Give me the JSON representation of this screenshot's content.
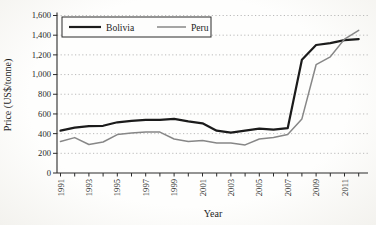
{
  "chart_data": {
    "type": "line",
    "title": "",
    "xlabel": "Year",
    "ylabel": "Price (US$/tonne)",
    "x": [
      1991,
      1992,
      1993,
      1994,
      1995,
      1996,
      1997,
      1998,
      1999,
      2000,
      2001,
      2002,
      2003,
      2004,
      2005,
      2006,
      2007,
      2008,
      2009,
      2010,
      2011,
      2012
    ],
    "x_tick_labels": [
      "1991",
      "1993",
      "1995",
      "1997",
      "1999",
      "2001",
      "2003",
      "2005",
      "2007",
      "2009",
      "2011"
    ],
    "ylim": [
      0,
      1600
    ],
    "ytick_interval": 200,
    "ytick_labels": [
      "0",
      "200",
      "400",
      "600",
      "800",
      "1,000",
      "1,200",
      "1,400",
      "1,600"
    ],
    "grid": "horizontal dotted",
    "legend": {
      "position": "top-left inside",
      "entries": [
        "Bolivia",
        "Peru"
      ]
    },
    "series": [
      {
        "name": "Bolivia",
        "color": "#1b1b1b",
        "stroke_width": 2.2,
        "values": [
          430,
          460,
          475,
          480,
          515,
          530,
          540,
          540,
          550,
          525,
          505,
          430,
          410,
          430,
          450,
          440,
          455,
          1150,
          1300,
          1320,
          1350,
          1360
        ]
      },
      {
        "name": "Peru",
        "color": "#878787",
        "stroke_width": 1.5,
        "values": [
          320,
          360,
          290,
          315,
          390,
          405,
          415,
          415,
          345,
          320,
          330,
          305,
          305,
          285,
          345,
          360,
          390,
          550,
          1100,
          1180,
          1360,
          1450
        ]
      }
    ]
  },
  "style": {
    "grid_color": "#b3b3b3",
    "axis_color": "#2b2b2b",
    "legend_border": "#2b2b2b",
    "background": "#fdfdfc"
  }
}
